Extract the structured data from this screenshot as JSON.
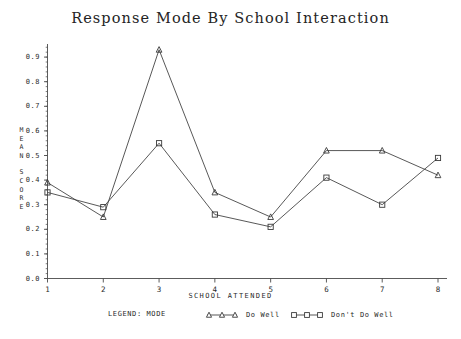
{
  "title": "Response Mode By School Interaction",
  "axes": {
    "x_title": "SCHOOL ATTENDED",
    "y_title_lines": [
      "M",
      "E",
      "A",
      "N",
      "",
      "S",
      "C",
      "O",
      "R",
      "E"
    ],
    "y_ticks": [
      "0.9",
      "0.8",
      "0.7",
      "0.6",
      "0.5",
      "0.4",
      "0.3",
      "0.2",
      "0.1",
      "0.0"
    ],
    "x_ticks": [
      "1",
      "2",
      "3",
      "4",
      "5",
      "6",
      "7",
      "8"
    ]
  },
  "legend": {
    "title": "LEGEND: MODE",
    "entries": [
      {
        "label": "Do Well",
        "marker": "triangle-up-marker"
      },
      {
        "label": "Don't Do Well",
        "marker": "square-marker"
      }
    ]
  },
  "colors": {
    "line": "#3a3a3a",
    "axis": "#4a4a4a",
    "text": "#2a2a2a",
    "background": "#ffffff"
  },
  "chart_data": {
    "type": "line",
    "title": "Response Mode By School Interaction",
    "xlabel": "SCHOOL ATTENDED",
    "ylabel": "MEAN SCORE",
    "categories": [
      "1",
      "2",
      "3",
      "4",
      "5",
      "6",
      "7",
      "8"
    ],
    "x": [
      1,
      2,
      3,
      4,
      5,
      6,
      7,
      8
    ],
    "xlim": [
      1,
      8
    ],
    "ylim": [
      0.0,
      0.95
    ],
    "y_ticks": [
      0.0,
      0.1,
      0.2,
      0.3,
      0.4,
      0.5,
      0.6,
      0.7,
      0.8,
      0.9
    ],
    "grid": false,
    "legend_position": "bottom",
    "series": [
      {
        "name": "Do Well",
        "marker": "triangle",
        "values": [
          0.39,
          0.25,
          0.93,
          0.35,
          0.25,
          0.52,
          0.52,
          0.42
        ]
      },
      {
        "name": "Don't Do Well",
        "marker": "square",
        "values": [
          0.35,
          0.29,
          0.55,
          0.26,
          0.21,
          0.41,
          0.3,
          0.49
        ]
      }
    ]
  }
}
